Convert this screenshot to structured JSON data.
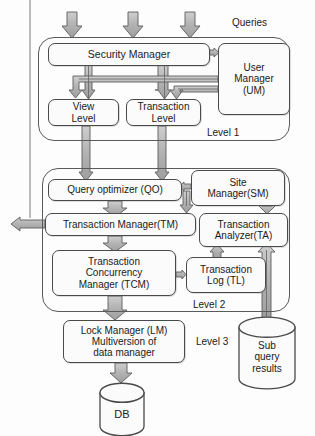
{
  "diagram": {
    "labels": {
      "queries": "Queries",
      "level1": "Level 1",
      "level2": "Level 2",
      "level3": "Level 3"
    },
    "nodes": {
      "security_manager": "Security Manager",
      "user_manager": "User\nManager\n(UM)",
      "user_manager_l1": "User",
      "user_manager_l2": "Manager",
      "user_manager_l3": "(UM)",
      "view_level_l1": "View",
      "view_level_l2": "Level",
      "transaction_level_l1": "Transaction",
      "transaction_level_l2": "Level",
      "query_optimizer": "Query optimizer (QO)",
      "site_manager_l1": "Site",
      "site_manager_l2": "Manager(SM)",
      "transaction_manager": "Transaction Manager(TM)",
      "transaction_analyzer_l1": "Transaction",
      "transaction_analyzer_l2": "Analyzer(TA)",
      "tcm_l1": "Transaction",
      "tcm_l2": "Concurrency",
      "tcm_l3": "Manager (TCM)",
      "transaction_log_l1": "Transaction",
      "transaction_log_l2": "Log (TL)",
      "lock_manager_l1": "Lock Manager (LM)",
      "lock_manager_l2": "Multiversion of",
      "lock_manager_l3": "data manager",
      "sub_query_l1": "Sub",
      "sub_query_l2": "query",
      "sub_query_l3": "results",
      "db": "DB"
    },
    "colors": {
      "arrow_fill": "#b7b7b7",
      "arrow_stroke": "#585858",
      "box_stroke": "#4a4a4a",
      "text": "#1a1a1a",
      "background": "#fdfdfd"
    }
  }
}
